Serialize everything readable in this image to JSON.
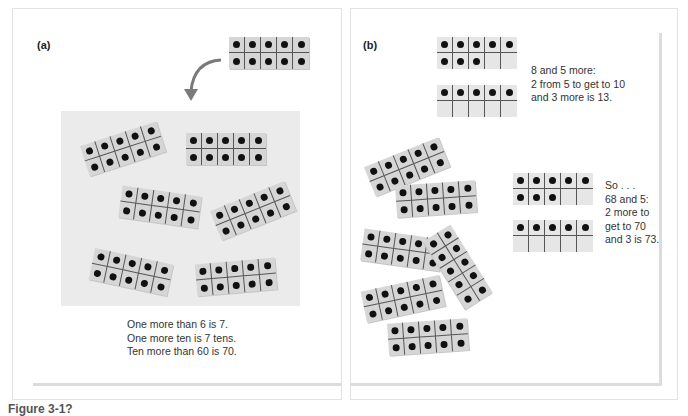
{
  "figure": {
    "caption": "Figure 3-1?"
  },
  "panel_a": {
    "label": "(a)",
    "incoming_frame": {
      "filled": 10,
      "rotation": 0
    },
    "mat_frames": [
      {
        "filled": 10,
        "rotation": -18
      },
      {
        "filled": 10,
        "rotation": 0
      },
      {
        "filled": 10,
        "rotation": 8
      },
      {
        "filled": 10,
        "rotation": -22
      },
      {
        "filled": 10,
        "rotation": 12
      },
      {
        "filled": 10,
        "rotation": -5
      }
    ],
    "caption_lines": [
      "One more than 6 is 7.",
      "One more ten is 7 tens.",
      "Ten more than 60 is 70."
    ]
  },
  "panel_b": {
    "label": "(b)",
    "top_example": {
      "frame_1_filled": 8,
      "frame_2_filled": 5,
      "caption_lines": [
        "8 and 5 more:",
        "2 from 5 to get to 10",
        "and 3 more is 13."
      ]
    },
    "scattered_frames": [
      {
        "filled": 10,
        "rotation": -22
      },
      {
        "filled": 10,
        "rotation": -4
      },
      {
        "filled": 10,
        "rotation": 8
      },
      {
        "filled": 10,
        "rotation": -32
      },
      {
        "filled": 10,
        "rotation": -12
      },
      {
        "filled": 10,
        "rotation": -4
      }
    ],
    "bottom_example": {
      "frame_1_filled": 8,
      "frame_2_filled": 5,
      "caption_lines": [
        "So . . .",
        "68 and 5:",
        "2 more to",
        "get to 70",
        "and 3 is 73."
      ]
    }
  },
  "colors": {
    "frame_fill": "#d6d6d6",
    "mat_fill": "#ebebeb",
    "dot": "#111111",
    "arrow": "#7a7a7a",
    "panel_border": "#e2e2e2"
  }
}
